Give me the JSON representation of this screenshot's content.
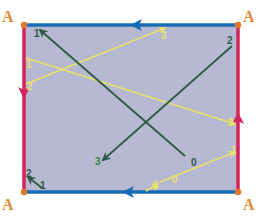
{
  "colors": {
    "background": "#ffffff",
    "rect_fill": "#b7b8d2",
    "horizontal_edges": "#1a6bb5",
    "vertical_edges": "#d4245a",
    "corner_dot": "#e07a2a",
    "corner_label": "#e08a3a",
    "green_path": "#2f5a45",
    "yellow_path": "#e9e36a"
  },
  "rect": {
    "x1": 24,
    "y1": 25,
    "x2": 238,
    "y2": 192
  },
  "corners": [
    {
      "name": "top-left",
      "label": "A",
      "x": 24,
      "y": 25,
      "lx": 2,
      "ly": 8
    },
    {
      "name": "top-right",
      "label": "A",
      "x": 238,
      "y": 25,
      "lx": 243,
      "ly": 8
    },
    {
      "name": "bottom-left",
      "label": "A",
      "x": 24,
      "y": 192,
      "lx": 2,
      "ly": 196
    },
    {
      "name": "bottom-right",
      "label": "A",
      "x": 238,
      "y": 192,
      "lx": 243,
      "ly": 196
    }
  ],
  "edge_arrows": [
    {
      "name": "top-edge-arrow",
      "direction": "left",
      "x": 136,
      "y": 25,
      "color": "horizontal_edges"
    },
    {
      "name": "bottom-edge-arrow",
      "direction": "left",
      "x": 128,
      "y": 192,
      "color": "horizontal_edges"
    },
    {
      "name": "left-edge-arrow",
      "direction": "down",
      "x": 24,
      "y": 93,
      "color": "vertical_edges"
    },
    {
      "name": "right-edge-arrow",
      "direction": "up",
      "x": 238,
      "y": 118,
      "color": "vertical_edges"
    }
  ],
  "green_segments": [
    {
      "name": "green-segment-0-1",
      "x1": 185,
      "y1": 156,
      "x2": 40,
      "y2": 30,
      "arrow": true
    },
    {
      "name": "green-segment-2-3",
      "x1": 232,
      "y1": 46,
      "x2": 103,
      "y2": 160,
      "arrow": true
    },
    {
      "name": "green-segment-corner-1-2",
      "x1": 42,
      "y1": 188,
      "x2": 28,
      "y2": 177,
      "arrow": true
    }
  ],
  "yellow_segments": [
    {
      "name": "yellow-segment-left-to-right-2",
      "x1": 26,
      "y1": 58,
      "x2": 235,
      "y2": 124,
      "arrow": true
    },
    {
      "name": "yellow-segment-left2-to-top3",
      "x1": 26,
      "y1": 84,
      "x2": 165,
      "y2": 28,
      "arrow": true
    },
    {
      "name": "yellow-segment-0-to-right-1",
      "x1": 160,
      "y1": 182,
      "x2": 235,
      "y2": 152,
      "arrow": true
    },
    {
      "name": "yellow-segment-3-to-0",
      "x1": 146,
      "y1": 191,
      "x2": 158,
      "y2": 184,
      "arrow": true
    }
  ],
  "point_labels": [
    {
      "name": "green-label-1-top",
      "text": "1",
      "x": 34,
      "y": 29,
      "style": "green"
    },
    {
      "name": "green-label-2-top-right",
      "text": "2",
      "x": 227,
      "y": 36,
      "style": "green"
    },
    {
      "name": "green-label-3",
      "text": "3",
      "x": 95,
      "y": 157,
      "style": "green-bright"
    },
    {
      "name": "green-label-0",
      "text": "0",
      "x": 191,
      "y": 158,
      "style": "green"
    },
    {
      "name": "green-label-2-bottom-left",
      "text": "2",
      "x": 26,
      "y": 169,
      "style": "green"
    },
    {
      "name": "green-label-1-bottom-left",
      "text": "1",
      "x": 40,
      "y": 181,
      "style": "green"
    },
    {
      "name": "yellow-label-3-top",
      "text": "3",
      "x": 161,
      "y": 31,
      "style": "yellow"
    },
    {
      "name": "yellow-label-2-left",
      "text": "2",
      "x": 27,
      "y": 82,
      "style": "yellow"
    },
    {
      "name": "yellow-label-1-left",
      "text": "1",
      "x": 26,
      "y": 60,
      "style": "yellow"
    },
    {
      "name": "yellow-label-2-right",
      "text": "2",
      "x": 228,
      "y": 118,
      "style": "yellow"
    },
    {
      "name": "yellow-label-1-right",
      "text": "1",
      "x": 231,
      "y": 146,
      "style": "yellow"
    },
    {
      "name": "yellow-label-0-bottom",
      "text": "0",
      "x": 172,
      "y": 175,
      "style": "yellow"
    },
    {
      "name": "yellow-label-3-bottom",
      "text": "3",
      "x": 153,
      "y": 181,
      "style": "yellow"
    }
  ]
}
